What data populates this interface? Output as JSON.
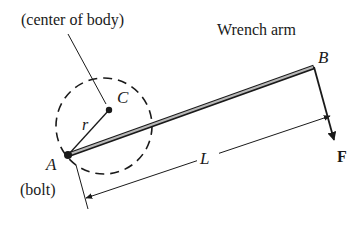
{
  "diagram": {
    "labels": {
      "center_of_body": "(center of body)",
      "wrench_arm": "Wrench arm",
      "point_c": "C",
      "point_b": "B",
      "point_a": "A",
      "bolt": "(bolt)",
      "radius": "r",
      "length": "L",
      "force": "F"
    },
    "colors": {
      "ink": "#1a1a1a",
      "arm_fill": "#b8b8b8",
      "background": "#ffffff"
    }
  }
}
